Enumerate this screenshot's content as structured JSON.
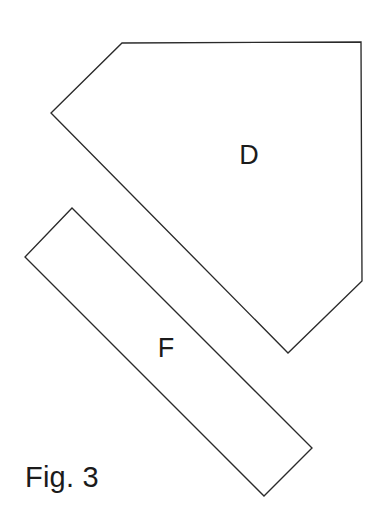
{
  "figure": {
    "caption": "Fig. 3",
    "background_color": "#ffffff",
    "stroke_color": "#2a2a2a",
    "stroke_width": 1.35,
    "canvas": {
      "width": 389,
      "height": 526
    }
  },
  "shapes": {
    "pentagon_d": {
      "label": "D",
      "label_x": 249,
      "label_y": 157,
      "points": "122,43 361,42 362,281 288,353 51,113",
      "vertices": [
        {
          "x": 122,
          "y": 43
        },
        {
          "x": 361,
          "y": 42
        },
        {
          "x": 362,
          "y": 281
        },
        {
          "x": 288,
          "y": 353
        },
        {
          "x": 51,
          "y": 113
        }
      ]
    },
    "bar_f": {
      "label": "F",
      "label_x": 166,
      "label_y": 350,
      "points": "72,208 312,448 264,496 25,257",
      "vertices": [
        {
          "x": 72,
          "y": 208
        },
        {
          "x": 312,
          "y": 448
        },
        {
          "x": 264,
          "y": 496
        },
        {
          "x": 25,
          "y": 257
        }
      ]
    }
  },
  "caption_position": {
    "x": 25,
    "y": 487
  }
}
